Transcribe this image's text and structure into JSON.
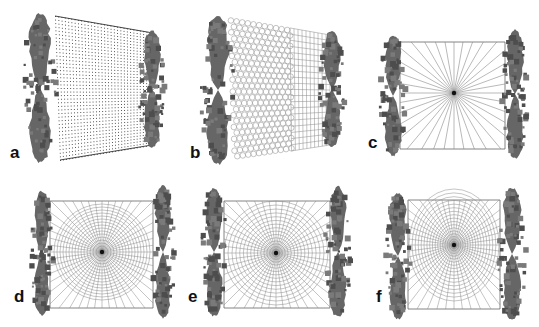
{
  "figure": {
    "colors": {
      "blob": "#666666",
      "blob_dark": "#4d4d4d",
      "mesh_line": "#8a8a8a",
      "mesh_dot": "#333333",
      "label": "#111111"
    },
    "panels": [
      {
        "id": "a",
        "label": "a",
        "type": "dot-grid",
        "frame": {
          "tl": [
            55,
            16
          ],
          "tr": [
            153,
            33
          ],
          "br": [
            152,
            145
          ],
          "bl": [
            60,
            160
          ]
        },
        "label_pos": [
          10,
          152
        ],
        "left_blob": {
          "cx": 40,
          "cy": 88,
          "rx": 17,
          "ry": 74
        },
        "right_blob": {
          "cx": 152,
          "cy": 89,
          "rx": 13,
          "ry": 58
        }
      },
      {
        "id": "b",
        "label": "b",
        "type": "hex-then-square-grid",
        "frame": {
          "tl": [
            228,
            17
          ],
          "tr": [
            330,
            35
          ],
          "br": [
            330,
            145
          ],
          "bl": [
            232,
            160
          ]
        },
        "divider_x": 290,
        "label_pos": [
          190,
          152
        ],
        "left_blob": {
          "cx": 218,
          "cy": 90,
          "rx": 17,
          "ry": 74
        },
        "right_blob": {
          "cx": 332,
          "cy": 89,
          "rx": 13,
          "ry": 58
        }
      },
      {
        "id": "c",
        "label": "c",
        "type": "radial-spokes",
        "frame": {
          "tl": [
            400,
            42
          ],
          "tr": [
            505,
            42
          ],
          "br": [
            505,
            149
          ],
          "bl": [
            400,
            149
          ]
        },
        "center": [
          454,
          93
        ],
        "spokes": 36,
        "label_pos": [
          368,
          142
        ],
        "left_blob": {
          "cx": 393,
          "cy": 96,
          "rx": 13,
          "ry": 60
        },
        "right_blob": {
          "cx": 515,
          "cy": 94,
          "rx": 13,
          "ry": 64
        }
      },
      {
        "id": "d",
        "label": "d",
        "type": "polar-circle-in-square",
        "frame": {
          "tl": [
            50,
            201
          ],
          "tr": [
            153,
            201
          ],
          "br": [
            153,
            308
          ],
          "bl": [
            50,
            308
          ]
        },
        "center": [
          102,
          252
        ],
        "radius": 48,
        "rings": 16,
        "spokes": 48,
        "label_pos": [
          14,
          296
        ],
        "left_blob": {
          "cx": 42,
          "cy": 253,
          "rx": 12,
          "ry": 62
        },
        "right_blob": {
          "cx": 163,
          "cy": 252,
          "rx": 12,
          "ry": 66
        }
      },
      {
        "id": "e",
        "label": "e",
        "type": "polar-graded-rings",
        "frame": {
          "tl": [
            224,
            201
          ],
          "tr": [
            330,
            201
          ],
          "br": [
            330,
            308
          ],
          "bl": [
            224,
            308
          ]
        },
        "center": [
          276,
          253
        ],
        "radius": 52,
        "rings": 16,
        "spokes": 48,
        "label_pos": [
          188,
          296
        ],
        "left_blob": {
          "cx": 214,
          "cy": 252,
          "rx": 13,
          "ry": 64
        },
        "right_blob": {
          "cx": 338,
          "cy": 252,
          "rx": 13,
          "ry": 65
        }
      },
      {
        "id": "f",
        "label": "f",
        "type": "polar-elliptic-graded",
        "frame": {
          "tl": [
            408,
            200
          ],
          "tr": [
            500,
            200
          ],
          "br": [
            500,
            309
          ],
          "bl": [
            408,
            309
          ]
        },
        "center": [
          454,
          245
        ],
        "radius_x": 45,
        "radius_y": 56,
        "rings": 18,
        "spokes": 48,
        "label_pos": [
          374,
          296
        ],
        "left_blob": {
          "cx": 398,
          "cy": 256,
          "rx": 13,
          "ry": 63
        },
        "right_blob": {
          "cx": 512,
          "cy": 254,
          "rx": 14,
          "ry": 66
        }
      }
    ]
  }
}
